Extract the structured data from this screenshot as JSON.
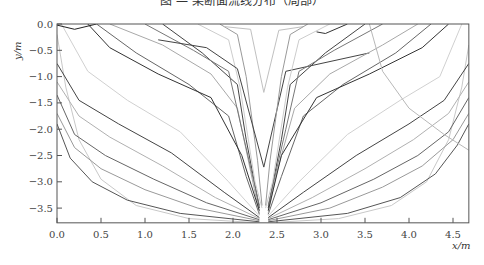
{
  "chart_data": {
    "type": "line",
    "xlabel": "x/m",
    "ylabel": "y/m",
    "xlim": [
      0.0,
      4.68
    ],
    "ylim": [
      -3.78,
      0.0
    ],
    "xticks": [
      "0.0",
      "0.5",
      "1.0",
      "1.5",
      "2.0",
      "2.5",
      "3.0",
      "3.5",
      "4.0",
      "4.5"
    ],
    "xtick_values": [
      0.0,
      0.5,
      1.0,
      1.5,
      2.0,
      2.5,
      3.0,
      3.5,
      4.0,
      4.5
    ],
    "yticks": [
      "0.0",
      "−0.5",
      "−1.0",
      "−1.5",
      "−2.0",
      "−2.5",
      "−3.0",
      "−3.5"
    ],
    "ytick_values": [
      0.0,
      -0.5,
      -1.0,
      -1.5,
      -2.0,
      -2.5,
      -3.0,
      -3.5
    ],
    "grid": false,
    "legend": null,
    "series": [
      {
        "name": "left-1",
        "color": "#c8c8c8",
        "points": [
          [
            0.0,
            -0.2
          ],
          [
            0.1,
            -1.2
          ],
          [
            0.25,
            -2.2
          ],
          [
            0.5,
            -2.95
          ],
          [
            0.9,
            -3.45
          ],
          [
            1.5,
            -3.7
          ],
          [
            2.3,
            -3.78
          ]
        ]
      },
      {
        "name": "left-2",
        "color": "#555555",
        "points": [
          [
            0.0,
            -1.9
          ],
          [
            0.15,
            -2.55
          ],
          [
            0.4,
            -3.0
          ],
          [
            0.8,
            -3.35
          ],
          [
            1.4,
            -3.6
          ],
          [
            2.3,
            -3.76
          ]
        ]
      },
      {
        "name": "left-3",
        "color": "#999999",
        "points": [
          [
            0.0,
            -1.7
          ],
          [
            0.2,
            -2.35
          ],
          [
            0.5,
            -2.75
          ],
          [
            1.0,
            -3.15
          ],
          [
            1.6,
            -3.5
          ],
          [
            2.3,
            -3.74
          ]
        ]
      },
      {
        "name": "left-4",
        "color": "#666666",
        "points": [
          [
            0.0,
            -1.35
          ],
          [
            0.2,
            -2.1
          ],
          [
            0.55,
            -2.5
          ],
          [
            1.1,
            -2.95
          ],
          [
            1.7,
            -3.4
          ],
          [
            2.3,
            -3.72
          ]
        ]
      },
      {
        "name": "left-5",
        "color": "#b0b0b0",
        "points": [
          [
            0.0,
            -1.1
          ],
          [
            0.25,
            -1.75
          ],
          [
            0.6,
            -2.15
          ],
          [
            1.2,
            -2.7
          ],
          [
            1.8,
            -3.3
          ],
          [
            2.3,
            -3.7
          ]
        ]
      },
      {
        "name": "left-6",
        "color": "#444444",
        "points": [
          [
            0.0,
            -0.75
          ],
          [
            0.25,
            -1.45
          ],
          [
            0.7,
            -1.9
          ],
          [
            1.3,
            -2.45
          ],
          [
            1.9,
            -3.2
          ],
          [
            2.3,
            -3.68
          ]
        ]
      },
      {
        "name": "left-7",
        "color": "#d0d0d0",
        "points": [
          [
            0.05,
            0.0
          ],
          [
            0.35,
            -0.9
          ],
          [
            0.8,
            -1.45
          ],
          [
            1.4,
            -2.05
          ],
          [
            1.95,
            -3.0
          ],
          [
            2.3,
            -3.65
          ]
        ]
      },
      {
        "name": "left-8",
        "color": "#666666",
        "points": [
          [
            0.45,
            0.0
          ],
          [
            0.9,
            -0.55
          ],
          [
            1.5,
            -1.15
          ],
          [
            1.95,
            -1.75
          ],
          [
            2.15,
            -2.9
          ],
          [
            2.3,
            -3.62
          ]
        ]
      },
      {
        "name": "left-9",
        "color": "#a8a8a8",
        "points": [
          [
            0.6,
            0.0
          ],
          [
            1.2,
            -0.4
          ],
          [
            1.75,
            -0.95
          ],
          [
            2.05,
            -1.6
          ],
          [
            2.2,
            -2.8
          ],
          [
            2.3,
            -3.6
          ]
        ]
      },
      {
        "name": "left-10",
        "color": "#333333",
        "points": [
          [
            0.35,
            0.0
          ],
          [
            0.6,
            -0.45
          ],
          [
            1.15,
            -0.95
          ],
          [
            1.75,
            -1.4
          ],
          [
            2.1,
            -2.5
          ],
          [
            2.3,
            -3.55
          ]
        ]
      },
      {
        "name": "left-11",
        "color": "#444444",
        "points": [
          [
            1.2,
            0.0
          ],
          [
            1.65,
            -0.55
          ],
          [
            2.05,
            -1.15
          ],
          [
            2.15,
            -2.2
          ],
          [
            2.3,
            -3.5
          ]
        ]
      },
      {
        "name": "left-12",
        "color": "#777777",
        "points": [
          [
            1.0,
            0.0
          ],
          [
            1.55,
            -0.5
          ],
          [
            1.95,
            -0.9
          ],
          [
            2.1,
            -2.0
          ],
          [
            2.3,
            -3.45
          ]
        ]
      },
      {
        "name": "left-13",
        "color": "#cccccc",
        "points": [
          [
            1.6,
            0.0
          ],
          [
            1.95,
            -0.3
          ],
          [
            2.08,
            -1.2
          ],
          [
            2.25,
            -3.0
          ],
          [
            2.33,
            -3.5
          ]
        ]
      },
      {
        "name": "left-14",
        "color": "#999999",
        "points": [
          [
            1.85,
            0.0
          ],
          [
            2.05,
            -0.2
          ],
          [
            2.15,
            -1.0
          ],
          [
            2.28,
            -2.6
          ],
          [
            2.33,
            -3.45
          ]
        ]
      },
      {
        "name": "left-15",
        "color": "#cccccc",
        "points": [
          [
            0.0,
            -0.05
          ],
          [
            0.02,
            0.0
          ]
        ]
      },
      {
        "name": "left-16",
        "color": "#222222",
        "points": [
          [
            0.0,
            -0.02
          ],
          [
            0.2,
            -0.1
          ],
          [
            0.45,
            0.0
          ]
        ]
      },
      {
        "name": "center-v",
        "color": "#444444",
        "points": [
          [
            1.15,
            -0.3
          ],
          [
            1.7,
            -0.45
          ],
          [
            2.05,
            -0.85
          ],
          [
            2.35,
            -2.72
          ],
          [
            2.6,
            -0.9
          ],
          [
            3.0,
            -0.75
          ],
          [
            3.55,
            -0.55
          ]
        ]
      },
      {
        "name": "center-v2",
        "color": "#c0c0c0",
        "points": [
          [
            1.9,
            -0.05
          ],
          [
            2.2,
            -0.1
          ],
          [
            2.35,
            -1.3
          ],
          [
            2.52,
            -0.12
          ],
          [
            2.8,
            -0.05
          ]
        ]
      },
      {
        "name": "right-1",
        "color": "#c8c8c8",
        "points": [
          [
            2.4,
            -3.78
          ],
          [
            3.2,
            -3.7
          ],
          [
            3.8,
            -3.45
          ],
          [
            4.2,
            -3.0
          ],
          [
            4.45,
            -2.2
          ],
          [
            4.6,
            -1.2
          ],
          [
            4.68,
            -0.4
          ]
        ]
      },
      {
        "name": "right-2",
        "color": "#555555",
        "points": [
          [
            2.4,
            -3.76
          ],
          [
            3.3,
            -3.6
          ],
          [
            3.9,
            -3.3
          ],
          [
            4.3,
            -2.85
          ],
          [
            4.55,
            -2.3
          ],
          [
            4.68,
            -1.9
          ]
        ]
      },
      {
        "name": "right-3",
        "color": "#999999",
        "points": [
          [
            2.4,
            -3.74
          ],
          [
            3.1,
            -3.5
          ],
          [
            3.7,
            -3.1
          ],
          [
            4.15,
            -2.7
          ],
          [
            4.5,
            -2.2
          ],
          [
            4.68,
            -1.7
          ]
        ]
      },
      {
        "name": "right-4",
        "color": "#666666",
        "points": [
          [
            2.4,
            -3.72
          ],
          [
            3.0,
            -3.4
          ],
          [
            3.6,
            -2.95
          ],
          [
            4.1,
            -2.5
          ],
          [
            4.45,
            -2.05
          ],
          [
            4.68,
            -1.4
          ]
        ]
      },
      {
        "name": "right-5",
        "color": "#b0b0b0",
        "points": [
          [
            2.4,
            -3.7
          ],
          [
            2.9,
            -3.3
          ],
          [
            3.5,
            -2.75
          ],
          [
            4.05,
            -2.2
          ],
          [
            4.45,
            -1.7
          ],
          [
            4.68,
            -1.1
          ]
        ]
      },
      {
        "name": "right-6",
        "color": "#444444",
        "points": [
          [
            2.4,
            -3.68
          ],
          [
            2.8,
            -3.2
          ],
          [
            3.4,
            -2.5
          ],
          [
            4.0,
            -1.9
          ],
          [
            4.4,
            -1.45
          ],
          [
            4.68,
            -0.75
          ]
        ]
      },
      {
        "name": "right-7",
        "color": "#d0d0d0",
        "points": [
          [
            2.4,
            -3.65
          ],
          [
            2.75,
            -3.0
          ],
          [
            3.3,
            -2.1
          ],
          [
            3.9,
            -1.45
          ],
          [
            4.35,
            -1.0
          ],
          [
            4.6,
            0.0
          ]
        ]
      },
      {
        "name": "right-8",
        "color": "#666666",
        "points": [
          [
            2.4,
            -3.62
          ],
          [
            2.55,
            -2.9
          ],
          [
            2.8,
            -1.75
          ],
          [
            3.25,
            -1.15
          ],
          [
            3.85,
            -0.55
          ],
          [
            4.25,
            0.0
          ]
        ]
      },
      {
        "name": "right-9",
        "color": "#a8a8a8",
        "points": [
          [
            2.4,
            -3.6
          ],
          [
            2.5,
            -2.8
          ],
          [
            2.7,
            -1.6
          ],
          [
            3.1,
            -0.95
          ],
          [
            3.7,
            -0.4
          ],
          [
            4.1,
            0.0
          ]
        ]
      },
      {
        "name": "right-10",
        "color": "#333333",
        "points": [
          [
            2.4,
            -3.55
          ],
          [
            2.55,
            -2.5
          ],
          [
            2.95,
            -1.4
          ],
          [
            3.55,
            -0.95
          ],
          [
            4.15,
            -0.45
          ],
          [
            4.45,
            0.0
          ]
        ]
      },
      {
        "name": "right-11",
        "color": "#444444",
        "points": [
          [
            2.4,
            -3.5
          ],
          [
            2.55,
            -2.2
          ],
          [
            2.65,
            -1.15
          ],
          [
            3.05,
            -0.55
          ],
          [
            3.5,
            0.0
          ]
        ]
      },
      {
        "name": "right-12",
        "color": "#777777",
        "points": [
          [
            2.4,
            -3.45
          ],
          [
            2.6,
            -2.0
          ],
          [
            2.75,
            -0.9
          ],
          [
            3.15,
            -0.5
          ],
          [
            3.7,
            0.0
          ]
        ]
      },
      {
        "name": "right-13",
        "color": "#cccccc",
        "points": [
          [
            2.37,
            -3.5
          ],
          [
            2.45,
            -3.0
          ],
          [
            2.62,
            -1.2
          ],
          [
            2.75,
            -0.3
          ],
          [
            3.1,
            0.0
          ]
        ]
      },
      {
        "name": "right-14",
        "color": "#999999",
        "points": [
          [
            2.37,
            -3.45
          ],
          [
            2.42,
            -2.6
          ],
          [
            2.55,
            -1.0
          ],
          [
            2.65,
            -0.2
          ],
          [
            2.85,
            0.0
          ]
        ]
      },
      {
        "name": "right-15",
        "color": "#333333",
        "points": [
          [
            3.3,
            0.0
          ],
          [
            3.05,
            -0.18
          ],
          [
            2.95,
            -0.15
          ]
        ]
      },
      {
        "name": "right-16",
        "color": "#b8b8b8",
        "points": [
          [
            3.55,
            0.0
          ],
          [
            3.7,
            -0.9
          ],
          [
            4.0,
            -1.6
          ],
          [
            4.4,
            -2.1
          ],
          [
            4.68,
            -2.4
          ]
        ]
      }
    ]
  },
  "axes": {
    "xlabel": "x/m",
    "ylabel": "y/m"
  },
  "title": "图 — 某断面流线分布（局部）"
}
